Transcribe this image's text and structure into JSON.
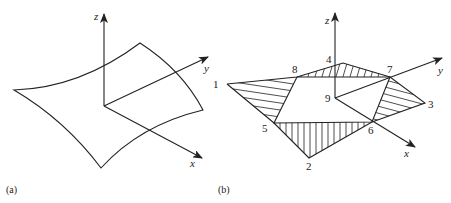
{
  "figure": {
    "panels": [
      {
        "id": "a",
        "caption": "(a)",
        "description": "Curved quadrilateral surface with x, y, z axes",
        "axes": {
          "x_label": "x",
          "y_label": "y",
          "z_label": "z"
        }
      },
      {
        "id": "b",
        "caption": "(b)",
        "description": "Surface approximated by nine nodes with hatched triangles",
        "axes": {
          "x_label": "x",
          "y_label": "y",
          "z_label": "z"
        },
        "nodes": [
          "1",
          "2",
          "3",
          "4",
          "5",
          "6",
          "7",
          "8",
          "9"
        ]
      }
    ]
  },
  "colors": {
    "stroke": "#222222",
    "background": "#ffffff"
  }
}
